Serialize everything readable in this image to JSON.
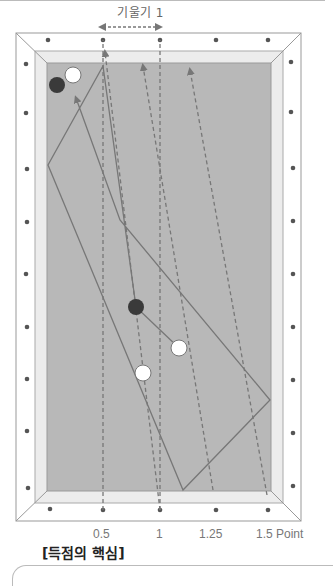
{
  "header": {
    "slope_label": "기울기 1"
  },
  "axis": {
    "ticks": [
      "0.5",
      "1",
      "1.25",
      "1.5 Point"
    ]
  },
  "caption": "[득점의 핵심]",
  "colors": {
    "felt": "#b8b8b8",
    "cushion": "#ececec",
    "rail": "#ffffff",
    "line": "#777777",
    "dark_ball": "#3a3a3a",
    "white_ball": "#ffffff",
    "diamond": "#555555"
  }
}
